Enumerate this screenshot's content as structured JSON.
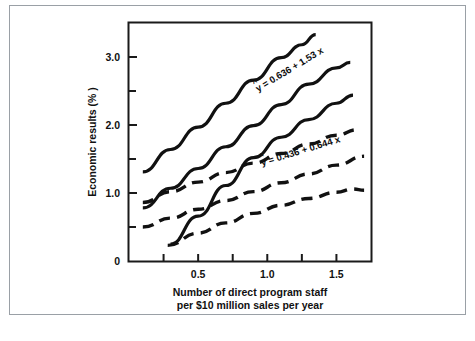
{
  "figure": {
    "background_color": "#ffffff",
    "frame_color": "#9aa0a6",
    "ink_color": "#111111"
  },
  "chart_data": {
    "type": "line",
    "title": "",
    "subtitle": "",
    "xlabel_line1": "Number of direct program staff",
    "xlabel_line2": "per $10 million sales per year",
    "ylabel": "Economic results (% )",
    "xlim": [
      0.0,
      1.75
    ],
    "ylim": [
      0.0,
      3.5
    ],
    "grid": false,
    "legend_position": "none",
    "x_ticks_major": [
      0.5,
      1.0,
      1.5
    ],
    "x_tick_labels": [
      "0.5",
      "1.0",
      "1.5"
    ],
    "x_ticks_minor": [
      0.25,
      0.75,
      1.25,
      1.75
    ],
    "y_ticks_major": [
      0,
      1.0,
      2.0,
      3.0
    ],
    "y_tick_labels": [
      "0",
      "1.0",
      "2.0",
      "3.0"
    ],
    "y_ticks_minor": [
      0.5,
      1.5,
      2.5,
      3.5
    ],
    "annotations": [
      {
        "name": "equation-upper",
        "hat_symbol": "^",
        "text": "y = 0.636 + 1.53 x",
        "slope": 1.53,
        "intercept": 0.636,
        "style": "solid"
      },
      {
        "name": "equation-lower",
        "hat_symbol": "^",
        "text": "y = 0.436 + 0.644 x",
        "slope": 0.644,
        "intercept": 0.436,
        "style": "dashed"
      }
    ],
    "series": [
      {
        "name": "solid-upper-confidence-band",
        "style": "solid",
        "x": [
          0.1,
          0.3,
          0.5,
          0.7,
          0.9,
          1.1,
          1.25,
          1.35
        ],
        "values": [
          1.31,
          1.64,
          1.97,
          2.32,
          2.66,
          2.99,
          3.18,
          3.33
        ]
      },
      {
        "name": "solid-regression-line",
        "style": "solid",
        "x": [
          0.1,
          0.3,
          0.5,
          0.7,
          0.9,
          1.1,
          1.3,
          1.5,
          1.6
        ],
        "values": [
          0.78,
          1.07,
          1.36,
          1.68,
          1.99,
          2.3,
          2.6,
          2.84,
          2.92
        ]
      },
      {
        "name": "solid-lower-confidence-band",
        "style": "solid",
        "x": [
          0.3,
          0.5,
          0.7,
          0.9,
          1.1,
          1.3,
          1.5,
          1.62
        ],
        "values": [
          0.25,
          0.66,
          1.11,
          1.52,
          1.82,
          2.08,
          2.32,
          2.44
        ]
      },
      {
        "name": "dashed-upper-confidence-band",
        "style": "dashed",
        "x": [
          0.1,
          0.3,
          0.5,
          0.7,
          0.9,
          1.1,
          1.3,
          1.5,
          1.65
        ],
        "values": [
          0.86,
          1.02,
          1.16,
          1.3,
          1.44,
          1.58,
          1.72,
          1.85,
          1.93
        ]
      },
      {
        "name": "dashed-regression-line",
        "style": "dashed",
        "x": [
          0.1,
          0.3,
          0.5,
          0.7,
          0.9,
          1.1,
          1.3,
          1.5,
          1.7
        ],
        "values": [
          0.5,
          0.63,
          0.76,
          0.89,
          1.02,
          1.15,
          1.28,
          1.41,
          1.54
        ]
      },
      {
        "name": "dashed-lower-confidence-band",
        "style": "dashed",
        "x": [
          0.28,
          0.5,
          0.7,
          0.9,
          1.1,
          1.3,
          1.5,
          1.62,
          1.7
        ],
        "values": [
          0.23,
          0.41,
          0.56,
          0.7,
          0.82,
          0.92,
          1.01,
          1.06,
          1.04
        ]
      }
    ]
  }
}
